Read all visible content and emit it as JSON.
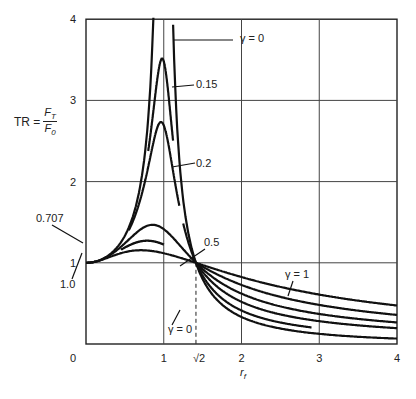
{
  "chart_data": {
    "type": "line",
    "title": "",
    "xlabel": "r_f",
    "ylabel": "TR = F_T / F_0",
    "xlim": [
      0,
      4
    ],
    "ylim": [
      0,
      4
    ],
    "grid": true,
    "x_ticks": [
      "0",
      "1",
      "√2",
      "2",
      "3",
      "4"
    ],
    "y_ticks": [
      "1",
      "2",
      "3",
      "4"
    ],
    "formula": "TR = sqrt((1+(2γr)^2)/((1-r^2)^2+(2γr)^2))",
    "series": [
      {
        "name": "γ = 0",
        "gamma": 0,
        "x": [
          0,
          0.5,
          0.8,
          0.9,
          0.95,
          1.05,
          1.1,
          1.2,
          1.414,
          2,
          3,
          4
        ],
        "y": [
          1,
          1.33,
          2.78,
          5.26,
          10.3,
          9.76,
          4.76,
          2.27,
          1.0,
          0.33,
          0.125,
          0.067
        ]
      },
      {
        "name": "0.15",
        "gamma": 0.15,
        "x": [
          0.85,
          0.95,
          1.0,
          1.05,
          1.1
        ],
        "y": [
          2.7,
          3.4,
          3.48,
          3.3,
          2.7
        ]
      },
      {
        "name": "0.2",
        "gamma": 0.2,
        "x": [
          0.6,
          0.8,
          1.0,
          1.2,
          1.414,
          2,
          3,
          4
        ],
        "y": [
          1.53,
          2.2,
          2.69,
          1.9,
          1.0,
          0.5,
          0.25,
          0.16
        ]
      },
      {
        "name": "0.5",
        "gamma": 0.5,
        "x": [
          0,
          0.5,
          0.8,
          1.0,
          1.2,
          1.414,
          2,
          3,
          4
        ],
        "y": [
          1,
          1.3,
          1.45,
          1.41,
          1.24,
          1.0,
          0.6,
          0.39,
          0.3
        ]
      },
      {
        "name": "0.707",
        "gamma": 0.707,
        "x": [
          0.5,
          0.8,
          1.0,
          1.414,
          2,
          3,
          4
        ],
        "y": [
          1.23,
          1.27,
          1.22,
          1.0,
          0.69,
          0.47,
          0.37
        ]
      },
      {
        "name": "γ = 1",
        "gamma": 1.0,
        "x": [
          0,
          0.5,
          0.8,
          1.0,
          1.414,
          2,
          3,
          4
        ],
        "y": [
          1,
          1.13,
          1.15,
          1.12,
          1.0,
          0.82,
          0.63,
          0.52
        ]
      }
    ],
    "annotations": [
      "γ = 0",
      "0.15",
      "0.2",
      "0.5",
      "0.707",
      "1.0",
      "γ = 1",
      "γ = 0"
    ]
  },
  "labels": {
    "ylabel_prefix": "TR =",
    "ylabel_num": "F",
    "ylabel_num_sub": "T",
    "ylabel_den": "F",
    "ylabel_den_sub": "0",
    "xlabel": "r",
    "xlabel_sub": "f"
  }
}
